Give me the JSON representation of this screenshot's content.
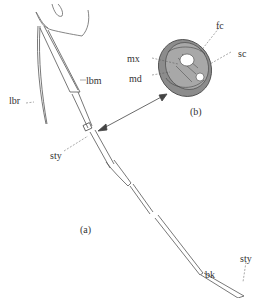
{
  "figure": {
    "panels": [
      {
        "id": "a",
        "label": "(a)"
      },
      {
        "id": "b",
        "label": "(b)"
      }
    ],
    "labels": {
      "lbr": "lbr",
      "lbm": "lbm",
      "sty_top": "sty",
      "sty_tip": "sty",
      "bk": "bk",
      "mx": "mx",
      "md": "md",
      "fc": "fc",
      "sc": "sc"
    },
    "colors": {
      "line": "#555555",
      "fill_gray": "#9a9a9a",
      "fill_light": "#c8c8c8",
      "background": "#ffffff"
    }
  }
}
